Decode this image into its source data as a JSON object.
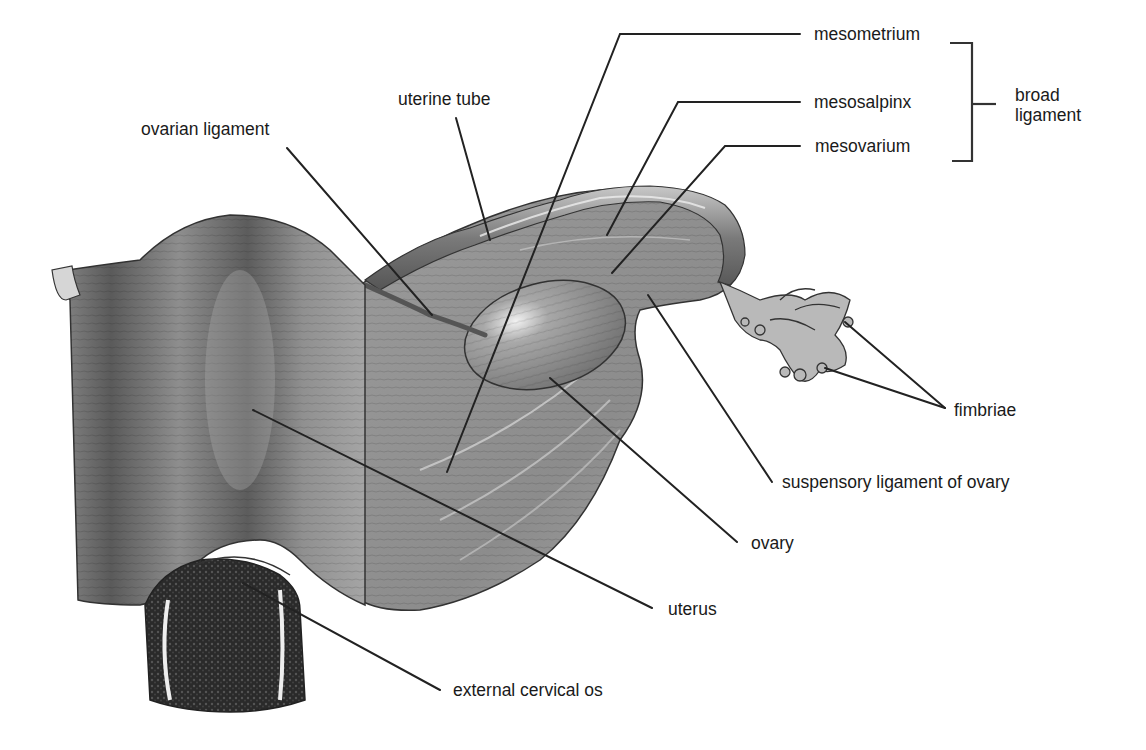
{
  "figure": {
    "background": "#ffffff",
    "line_color": "#222222",
    "text_color": "#1a1a1a"
  },
  "labels": {
    "mesometrium": "mesometrium",
    "mesosalpinx": "mesosalpinx",
    "mesovarium": "mesovarium",
    "broad_ligament_1": "broad",
    "broad_ligament_2": "ligament",
    "uterine_tube": "uterine tube",
    "ovarian_ligament": "ovarian ligament",
    "fimbriae": "fimbriae",
    "suspensory_ligament": "suspensory ligament of ovary",
    "ovary": "ovary",
    "uterus": "uterus",
    "external_cervical_os": "external cervical os"
  },
  "bracket": {
    "groups": [
      "mesometrium",
      "mesosalpinx",
      "mesovarium"
    ],
    "group_label": "broad ligament"
  }
}
